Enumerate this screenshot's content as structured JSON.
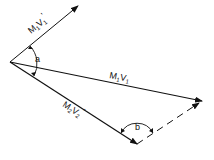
{
  "diagram": {
    "vectors": [
      {
        "id": "m1v1_prime",
        "label_main": "M",
        "label_sub1": "1",
        "label_v": "V",
        "label_sub2": "1",
        "label_prime": "'"
      },
      {
        "id": "m1v1",
        "label_main": "M",
        "label_sub1": "1",
        "label_v": "V",
        "label_sub2": "1",
        "label_prime": ""
      },
      {
        "id": "m2v2_prime",
        "label_main": "M",
        "label_sub1": "2",
        "label_v": "V",
        "label_sub2": "2",
        "label_prime": "'"
      }
    ],
    "angles": [
      {
        "id": "a",
        "label": "a"
      },
      {
        "id": "b",
        "label": "b"
      }
    ],
    "colors": {
      "stroke": "#111111",
      "background": "#ffffff"
    }
  }
}
